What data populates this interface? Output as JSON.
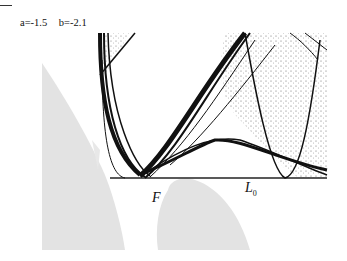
{
  "figure": {
    "params": {
      "a": "a=-1.5",
      "b": "b=-2.1"
    },
    "labels": {
      "F": "F",
      "L": "L",
      "L_sub": "0"
    },
    "colors": {
      "attractor": "#111111",
      "basin": "#e3e3e3",
      "baseline": "#222222"
    }
  }
}
